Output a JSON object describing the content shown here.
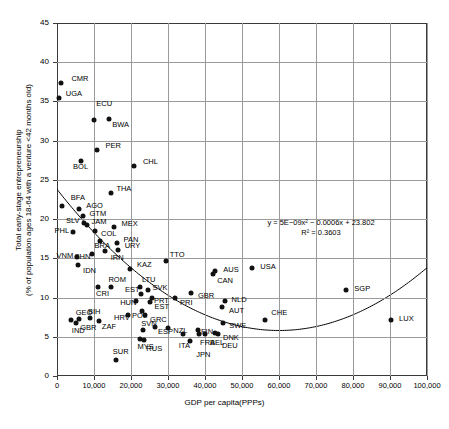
{
  "chart_data": {
    "type": "scatter",
    "title": "",
    "xlabel": "GDP per capita(PPPs)",
    "ylabel_line1": "Total early-stage entrepreneurship",
    "ylabel_line2": "(% of population ages 18-64 with a venture <42 months old)",
    "xlim": [
      0,
      100000
    ],
    "ylim": [
      0,
      45
    ],
    "xticks": [
      "0",
      "10,000",
      "20,000",
      "30,000",
      "40,000",
      "50,000",
      "60,000",
      "70,000",
      "80,000",
      "90,000",
      "100,000"
    ],
    "xtick_values": [
      0,
      10000,
      20000,
      30000,
      40000,
      50000,
      60000,
      70000,
      80000,
      90000,
      100000
    ],
    "yticks": [
      "0",
      "5",
      "10",
      "15",
      "20",
      "25",
      "30",
      "35",
      "40",
      "45"
    ],
    "ytick_values": [
      0,
      5,
      10,
      15,
      20,
      25,
      30,
      35,
      40,
      45
    ],
    "grid": true,
    "legend": "none",
    "marker_color": "#111111",
    "grid_color": "#9a9a9a",
    "axis_color": "#3a3a3a",
    "trendline": {
      "type": "polynomial",
      "order": 2,
      "equation": "y = 5E−09x² − 0.0006x + 23.802",
      "r_squared": "R² = 0.3603",
      "a": 5e-09,
      "b": -0.0006,
      "c": 23.802,
      "color": "#000000"
    },
    "points": [
      {
        "label": "CMR",
        "x": 1200,
        "y": 37.4,
        "lx": 10,
        "ly": -4
      },
      {
        "label": "UGA",
        "x": 500,
        "y": 35.4,
        "lx": 7,
        "ly": -4
      },
      {
        "label": "ECU",
        "x": 10100,
        "y": 32.6,
        "lx": 2,
        "ly": -16
      },
      {
        "label": "BWA",
        "x": 14100,
        "y": 32.8,
        "lx": 3,
        "ly": 6
      },
      {
        "label": "PER",
        "x": 10700,
        "y": 28.8,
        "lx": 9,
        "ly": -4
      },
      {
        "label": "BOL",
        "x": 6500,
        "y": 27.4,
        "lx": -8,
        "ly": 6
      },
      {
        "label": "CHL",
        "x": 20800,
        "y": 26.8,
        "lx": 9,
        "ly": -4
      },
      {
        "label": "THA",
        "x": 14700,
        "y": 23.3,
        "lx": 5,
        "ly": -4
      },
      {
        "label": "BFA",
        "x": 1300,
        "y": 21.7,
        "lx": 9,
        "ly": -8
      },
      {
        "label": "AGO",
        "x": 6000,
        "y": 21.3,
        "lx": 7,
        "ly": -3
      },
      {
        "label": "GTM",
        "x": 6900,
        "y": 20.4,
        "lx": 7,
        "ly": -2
      },
      {
        "label": "SLV",
        "x": 7300,
        "y": 19.5,
        "lx": -18,
        "ly": -2
      },
      {
        "label": "JAM",
        "x": 8000,
        "y": 19.3,
        "lx": 5,
        "ly": -3
      },
      {
        "label": "MEX",
        "x": 15300,
        "y": 19.0,
        "lx": 8,
        "ly": -3
      },
      {
        "label": "PHL",
        "x": 4200,
        "y": 18.4,
        "lx": -18,
        "ly": -1
      },
      {
        "label": "COL",
        "x": 10300,
        "y": 18.5,
        "lx": 6,
        "ly": 3
      },
      {
        "label": "BRA",
        "x": 11500,
        "y": 17.2,
        "lx": -5,
        "ly": 5
      },
      {
        "label": "PAN",
        "x": 16100,
        "y": 16.9,
        "lx": 7,
        "ly": -3
      },
      {
        "label": "URY",
        "x": 16400,
        "y": 16.0,
        "lx": 7,
        "ly": 0
      },
      {
        "label": "CHN",
        "x": 9500,
        "y": 15.5,
        "lx": -18,
        "ly": 3
      },
      {
        "label": "VNM",
        "x": 5300,
        "y": 15.2,
        "lx": -20,
        "ly": -1
      },
      {
        "label": "IRN",
        "x": 12900,
        "y": 15.9,
        "lx": 0,
        "ly": 7
      },
      {
        "label": "TTO",
        "x": 29400,
        "y": 14.7,
        "lx": 4,
        "ly": -6
      },
      {
        "label": "IDN",
        "x": 5700,
        "y": 14.2,
        "lx": 5,
        "ly": 6
      },
      {
        "label": "KAZ",
        "x": 19700,
        "y": 13.7,
        "lx": 7,
        "ly": 0
      },
      {
        "label": "AUS",
        "x": 42800,
        "y": 13.4,
        "lx": 8,
        "ly": -1
      },
      {
        "label": "CAN",
        "x": 42200,
        "y": 13.0,
        "lx": 4,
        "ly": 7
      },
      {
        "label": "USA",
        "x": 52800,
        "y": 13.8,
        "lx": 8,
        "ly": -1
      },
      {
        "label": "ROM",
        "x": 14700,
        "y": 11.3,
        "lx": -3,
        "ly": -7
      },
      {
        "label": "CRI",
        "x": 11100,
        "y": 11.3,
        "lx": -2,
        "ly": 7
      },
      {
        "label": "LTU",
        "x": 22400,
        "y": 11.3,
        "lx": 2,
        "ly": -7
      },
      {
        "label": "SVK",
        "x": 24700,
        "y": 11.0,
        "lx": 4,
        "ly": -2
      },
      {
        "label": "GBR",
        "x": 36200,
        "y": 10.6,
        "lx": 7,
        "ly": 3
      },
      {
        "label": "EST",
        "x": 22700,
        "y": 10.4,
        "lx": -16,
        "ly": 0
      },
      {
        "label": "PRT",
        "x": 25700,
        "y": 10.0,
        "lx": 2,
        "ly": 3
      },
      {
        "label": "PRI",
        "x": 31900,
        "y": 10.0,
        "lx": 5,
        "ly": 5
      },
      {
        "label": "NLD",
        "x": 45300,
        "y": 9.6,
        "lx": 7,
        "ly": -1
      },
      {
        "label": "HUN",
        "x": 21400,
        "y": 9.5,
        "lx": -16,
        "ly": 2
      },
      {
        "label": "EST",
        "x": 25000,
        "y": 9.4,
        "lx": 5,
        "ly": 5
      },
      {
        "label": "AUT",
        "x": 44600,
        "y": 8.8,
        "lx": 7,
        "ly": 4
      },
      {
        "label": "POL",
        "x": 23000,
        "y": 8.3,
        "lx": -10,
        "ly": 5
      },
      {
        "label": "GEO",
        "x": 3700,
        "y": 7.2,
        "lx": 5,
        "ly": -7
      },
      {
        "label": "IND",
        "x": 5100,
        "y": 6.8,
        "lx": -4,
        "ly": 8
      },
      {
        "label": "GBR",
        "x": 6000,
        "y": 7.3,
        "lx": 1,
        "ly": 9
      },
      {
        "label": "BIH",
        "x": 8900,
        "y": 7.4,
        "lx": -2,
        "ly": -6
      },
      {
        "label": "HRV",
        "x": 19200,
        "y": 7.8,
        "lx": -14,
        "ly": 3
      },
      {
        "label": "ZAF",
        "x": 11300,
        "y": 7.0,
        "lx": 3,
        "ly": 6
      },
      {
        "label": "GRC",
        "x": 23800,
        "y": 7.8,
        "lx": 5,
        "ly": 5
      },
      {
        "label": "CHE",
        "x": 56300,
        "y": 7.1,
        "lx": 0,
        "ly": -7
      },
      {
        "label": "LUX",
        "x": 90300,
        "y": 7.1,
        "lx": 8,
        "ly": -1
      },
      {
        "label": "SGP",
        "x": 78200,
        "y": 10.9,
        "lx": 8,
        "ly": -1
      },
      {
        "label": "SWE",
        "x": 44900,
        "y": 6.7,
        "lx": 6,
        "ly": 3
      },
      {
        "label": "SVN",
        "x": 23300,
        "y": 5.9,
        "lx": -2,
        "ly": -6
      },
      {
        "label": "ESP",
        "x": 26500,
        "y": 6.3,
        "lx": 3,
        "ly": 5
      },
      {
        "label": "NZL",
        "x": 30100,
        "y": 6.1,
        "lx": 5,
        "ly": 3
      },
      {
        "label": "FIN",
        "x": 38100,
        "y": 5.9,
        "lx": 3,
        "ly": 2
      },
      {
        "label": "DNK",
        "x": 42700,
        "y": 5.5,
        "lx": 8,
        "ly": 5
      },
      {
        "label": "MYS",
        "x": 22300,
        "y": 4.7,
        "lx": -2,
        "ly": 8
      },
      {
        "label": "RUS",
        "x": 23600,
        "y": 4.6,
        "lx": 2,
        "ly": 9
      },
      {
        "label": "ITA",
        "x": 34000,
        "y": 5.4,
        "lx": -4,
        "ly": 12
      },
      {
        "label": "JPN",
        "x": 36000,
        "y": 4.5,
        "lx": 0,
        "ly": 14
      },
      {
        "label": "FRA",
        "x": 38400,
        "y": 5.3,
        "lx": 1,
        "ly": 9
      },
      {
        "label": "BEL",
        "x": 40000,
        "y": 5.4,
        "lx": 5,
        "ly": 9
      },
      {
        "label": "DEU",
        "x": 43500,
        "y": 5.3,
        "lx": 4,
        "ly": 12
      },
      {
        "label": "SUR",
        "x": 15900,
        "y": 2.1,
        "lx": -3,
        "ly": -8
      }
    ]
  }
}
